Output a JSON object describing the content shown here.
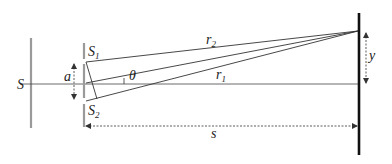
{
  "diagram": {
    "labels": {
      "source": "S",
      "slit1": "S",
      "slit1_sub": "1",
      "slit2": "S",
      "slit2_sub": "2",
      "slit_separation": "a",
      "angle": "θ",
      "path1": "r",
      "path1_sub": "1",
      "path2": "r",
      "path2_sub": "2",
      "screen_distance": "s",
      "screen_offset": "y"
    },
    "colors": {
      "barrier": "#9a9a9a",
      "screen": "#111111",
      "rays": "#333333",
      "dashed": "#444444"
    }
  }
}
